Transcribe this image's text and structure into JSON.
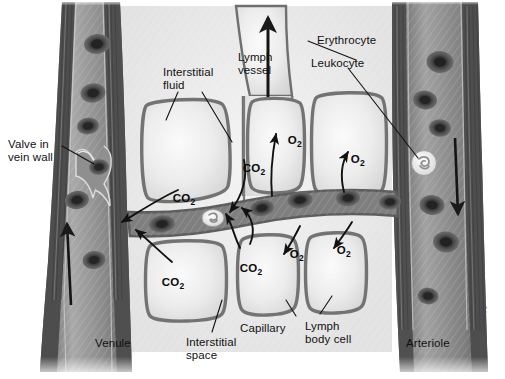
{
  "figure": {
    "kind": "anatomical-illustration",
    "style": "grayscale medical diagram",
    "width": 505,
    "height": 379,
    "background": "#ffffff"
  },
  "colors": {
    "background": "#ffffff",
    "vessel_wall_dark": "#4a4a4a",
    "vessel_wall_mid": "#6f6f6f",
    "vessel_lumen": "#8c8c8c",
    "cell_fill_light": "#e8e8e8",
    "cell_border": "#7a7a7a",
    "capillary_lumen": "#7d7d7d",
    "erythrocyte": "#3a3a3a",
    "leukocyte": "#efefef",
    "label_text": "#111111",
    "arrow": "#121212"
  },
  "labels": [
    {
      "id": "valve-in-vein-wall",
      "text": "Valve in\nvein wall",
      "x": 8,
      "y": 138,
      "align": "left"
    },
    {
      "id": "interstitial-fluid",
      "text": "Interstitial\nfluid",
      "x": 163,
      "y": 66,
      "align": "left"
    },
    {
      "id": "lymph-vessel",
      "text": "Lymph\nvessel",
      "x": 238,
      "y": 51,
      "align": "left"
    },
    {
      "id": "erythrocyte",
      "text": "Erythrocyte",
      "x": 317,
      "y": 34,
      "align": "left"
    },
    {
      "id": "leukocyte",
      "text": "Leukocyte",
      "x": 311,
      "y": 57,
      "align": "left"
    },
    {
      "id": "venule",
      "text": "Venule",
      "x": 95,
      "y": 337,
      "align": "left"
    },
    {
      "id": "interstitial-space",
      "text": "Interstitial\nspace",
      "x": 186,
      "y": 336,
      "align": "left"
    },
    {
      "id": "capillary",
      "text": "Capillary",
      "x": 298,
      "y": 322,
      "align": "left"
    },
    {
      "id": "lymph-body-cell",
      "text": "Lymph\nbody cell",
      "x": 305,
      "y": 320,
      "align": "left"
    },
    {
      "id": "arteriole",
      "text": "Arteriole",
      "x": 406,
      "y": 337,
      "align": "left"
    }
  ],
  "gas_labels": [
    {
      "id": "co2-left-upper",
      "gas": "CO",
      "sub": "2",
      "x": 166,
      "y": 180
    },
    {
      "id": "co2-left-lower",
      "gas": "CO",
      "sub": "2",
      "x": 155,
      "y": 264
    },
    {
      "id": "co2-mid-upper",
      "gas": "CO",
      "sub": "2",
      "x": 236,
      "y": 150
    },
    {
      "id": "co2-mid-lower",
      "gas": "CO",
      "sub": "2",
      "x": 233,
      "y": 250
    },
    {
      "id": "o2-upper-left",
      "gas": "O",
      "sub": "2",
      "x": 281,
      "y": 122
    },
    {
      "id": "o2-upper-right",
      "gas": "O",
      "sub": "2",
      "x": 344,
      "y": 141
    },
    {
      "id": "o2-lower-left",
      "gas": "O",
      "sub": "2",
      "x": 283,
      "y": 236
    },
    {
      "id": "o2-lower-right",
      "gas": "O",
      "sub": "2",
      "x": 330,
      "y": 232
    }
  ],
  "vessels": [
    {
      "id": "venule",
      "name": "Venule",
      "side": "left",
      "flow_direction": "up",
      "contains": [
        "erythrocyte",
        "valve"
      ]
    },
    {
      "id": "arteriole",
      "name": "Arteriole",
      "side": "right",
      "flow_direction": "down",
      "contains": [
        "erythrocyte",
        "leukocyte"
      ]
    },
    {
      "id": "capillary",
      "name": "Capillary",
      "side": "center",
      "flow_direction": "right",
      "contains": [
        "erythrocyte",
        "leukocyte"
      ]
    },
    {
      "id": "lymph",
      "name": "Lymph vessel",
      "side": "center",
      "flow_direction": "up",
      "contains": [
        "interstitial fluid"
      ]
    }
  ],
  "signature": {
    "text": "artist",
    "x": 470,
    "y": 330
  }
}
